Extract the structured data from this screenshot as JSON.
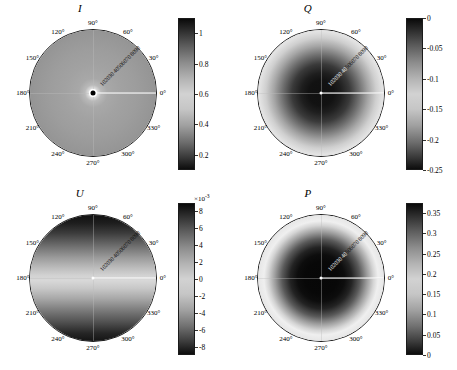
{
  "figure": {
    "panel_count": 4,
    "background": "#ffffff"
  },
  "chart_data": [
    {
      "type": "heatmap",
      "projection": "polar",
      "title": "I",
      "panel_position": "top-left",
      "colormap": "gray",
      "colorbar": {
        "ticks": [
          1,
          0.8,
          0.6,
          0.4,
          0.2
        ],
        "tick_labels": [
          "1",
          "0.8",
          "0.6",
          "0.4",
          "0.2"
        ],
        "range": [
          0.1,
          1.1
        ],
        "exponent_label": "",
        "orientation": "vertical",
        "position": "right"
      },
      "angular_ticks": [
        0,
        30,
        60,
        90,
        120,
        150,
        180,
        210,
        240,
        270,
        300,
        330
      ],
      "angular_tick_labels": [
        "0°",
        "30°",
        "60°",
        "90°",
        "120°",
        "150°",
        "180°",
        "210°",
        "240°",
        "270°",
        "300°",
        "330°"
      ],
      "radial_ticks": [
        10,
        20,
        30,
        40,
        50,
        60,
        70,
        80,
        90
      ],
      "radial_tick_labels": [
        "10",
        "20",
        "30",
        "40",
        "50",
        "60",
        "70",
        "80",
        "90"
      ],
      "radial_axis_angle_deg": 45,
      "description": "Bright halo at center, uniform mid-gray disc darkening toward rim",
      "radial_profile": {
        "r_norm": [
          0.0,
          0.03,
          0.05,
          0.1,
          0.2,
          0.35,
          0.5,
          0.7,
          0.85,
          1.0
        ],
        "values": [
          0.15,
          1.02,
          0.92,
          0.76,
          0.68,
          0.66,
          0.64,
          0.6,
          0.53,
          0.45
        ]
      }
    },
    {
      "type": "heatmap",
      "projection": "polar",
      "title": "Q",
      "panel_position": "top-right",
      "colormap": "gray",
      "colorbar": {
        "ticks": [
          0,
          -0.05,
          -0.1,
          -0.15,
          -0.2,
          -0.25
        ],
        "tick_labels": [
          "0",
          "-0.05",
          "-0.1",
          "-0.15",
          "-0.2",
          "-0.25"
        ],
        "range": [
          -0.25,
          0
        ],
        "exponent_label": "",
        "orientation": "vertical",
        "position": "right"
      },
      "angular_ticks": [
        0,
        30,
        60,
        90,
        120,
        150,
        180,
        210,
        240,
        270,
        300,
        330
      ],
      "angular_tick_labels": [
        "0°",
        "30°",
        "60°",
        "90°",
        "120°",
        "150°",
        "180°",
        "210°",
        "240°",
        "270°",
        "300°",
        "330°"
      ],
      "radial_ticks": [
        10,
        20,
        30,
        40,
        50,
        60,
        70,
        80,
        90
      ],
      "radial_tick_labels": [
        "10",
        "20",
        "30",
        "40",
        "50",
        "60",
        "70",
        "80",
        "90"
      ],
      "radial_axis_angle_deg": 45,
      "description": "Dark central blob, bright annulus at mid radius, darkening rim",
      "radial_profile": {
        "r_norm": [
          0.0,
          0.15,
          0.25,
          0.35,
          0.45,
          0.55,
          0.65,
          0.78,
          0.9,
          1.0
        ],
        "values": [
          -0.245,
          -0.24,
          -0.225,
          -0.185,
          -0.13,
          -0.075,
          -0.035,
          -0.055,
          -0.1,
          -0.16
        ]
      }
    },
    {
      "type": "heatmap",
      "projection": "polar",
      "title": "U",
      "panel_position": "bottom-left",
      "colormap": "gray",
      "colorbar": {
        "ticks": [
          8,
          6,
          4,
          2,
          0,
          -2,
          -4,
          -6,
          -8
        ],
        "tick_labels": [
          "8",
          "6",
          "4",
          "2",
          "0",
          "-2",
          "-4",
          "-6",
          "-8"
        ],
        "range": [
          -9,
          9
        ],
        "exponent_label": "×10",
        "exponent_power": "-3",
        "orientation": "vertical",
        "position": "right"
      },
      "angular_ticks": [
        0,
        30,
        60,
        90,
        120,
        150,
        180,
        210,
        240,
        270,
        300,
        330
      ],
      "angular_tick_labels": [
        "0°",
        "30°",
        "60°",
        "90°",
        "120°",
        "150°",
        "180°",
        "210°",
        "240°",
        "270°",
        "300°",
        "330°"
      ],
      "radial_ticks": [
        10,
        20,
        30,
        40,
        50,
        60,
        70,
        80,
        90
      ],
      "radial_tick_labels": [
        "10",
        "20",
        "30",
        "40",
        "50",
        "60",
        "70",
        "80",
        "90"
      ],
      "radial_axis_angle_deg": 45,
      "description": "Vertical antisymmetric gradient: dark at top and bottom, bright band through the middle",
      "vertical_profile": {
        "y_norm": [
          0.0,
          0.15,
          0.3,
          0.42,
          0.5,
          0.58,
          0.7,
          0.85,
          1.0
        ],
        "values": [
          -0.0085,
          -0.0055,
          -0.0015,
          0.0022,
          0.0032,
          0.0022,
          -0.0015,
          -0.0055,
          -0.0085
        ]
      }
    },
    {
      "type": "heatmap",
      "projection": "polar",
      "title": "P",
      "panel_position": "bottom-right",
      "colormap": "gray",
      "colorbar": {
        "ticks": [
          0.35,
          0.3,
          0.25,
          0.2,
          0.15,
          0.1,
          0.05,
          0
        ],
        "tick_labels": [
          "0.35",
          "0.3",
          "0.25",
          "0.2",
          "0.15",
          "0.1",
          "0.05",
          "0"
        ],
        "range": [
          0,
          0.375
        ],
        "exponent_label": "",
        "orientation": "vertical",
        "position": "right"
      },
      "angular_ticks": [
        0,
        30,
        60,
        90,
        120,
        150,
        180,
        210,
        240,
        270,
        300,
        330
      ],
      "angular_tick_labels": [
        "0°",
        "30°",
        "60°",
        "90°",
        "120°",
        "150°",
        "180°",
        "210°",
        "240°",
        "270°",
        "300°",
        "330°"
      ],
      "radial_ticks": [
        10,
        20,
        30,
        40,
        50,
        60,
        70,
        80,
        90
      ],
      "radial_tick_labels": [
        "10",
        "20",
        "30",
        "40",
        "50",
        "60",
        "70",
        "80",
        "90"
      ],
      "radial_axis_angle_deg": 45,
      "description": "Very dark core, strong bright ring at mid radius, mid-dark outer rim",
      "radial_profile": {
        "r_norm": [
          0.0,
          0.18,
          0.3,
          0.4,
          0.5,
          0.6,
          0.68,
          0.8,
          0.9,
          1.0
        ],
        "values": [
          0.01,
          0.012,
          0.03,
          0.09,
          0.19,
          0.3,
          0.36,
          0.28,
          0.19,
          0.13
        ]
      }
    }
  ]
}
